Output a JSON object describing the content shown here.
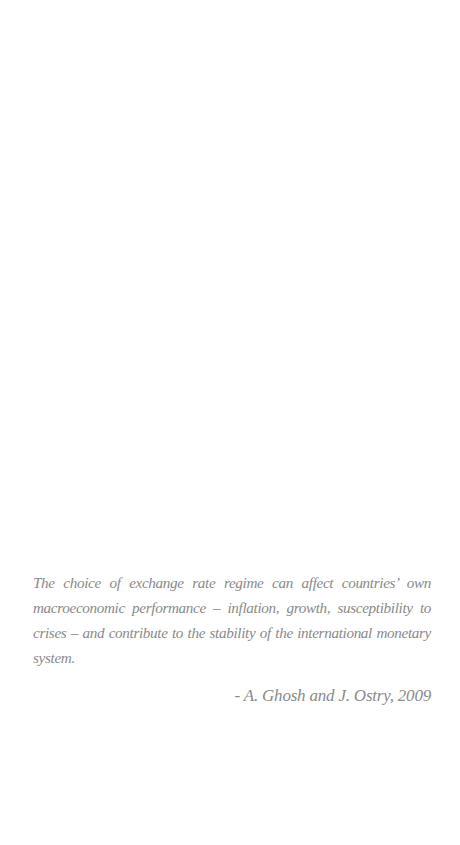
{
  "page": {
    "background": "#ffffff"
  },
  "epigraph": {
    "quote": "The choice of  exchange rate regime can affect countries’ own macroeconomic performance – inflation, growth, susceptibility to crises – and contribute to the stability of  the international monetary system.",
    "attribution": "- A. Ghosh and J. Ostry, 2009",
    "text_color": "#8a8a8a"
  }
}
